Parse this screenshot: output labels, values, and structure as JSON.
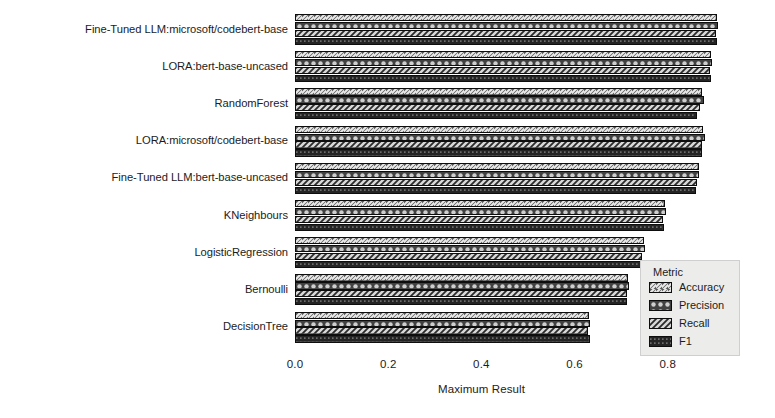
{
  "chart_data": {
    "type": "bar",
    "orientation": "horizontal",
    "grouped": true,
    "title": "",
    "xlabel": "Maximum Result",
    "ylabel": "Model Type",
    "xlim": [
      0,
      0.95
    ],
    "xticks": [
      "0.0",
      "0.2",
      "0.4",
      "0.6",
      "0.8"
    ],
    "xtick_values": [
      0.0,
      0.2,
      0.4,
      0.6,
      0.8
    ],
    "grid": false,
    "legend": {
      "title": "Metric",
      "position": "lower-right",
      "entries": [
        "Accuracy",
        "Precision",
        "Recall",
        "F1"
      ]
    },
    "categories": [
      "Fine-Tuned LLM:microsoft/codebert-base",
      "LORA:bert-base-uncased",
      "RandomForest",
      "LORA:microsoft/codebert-base",
      "Fine-Tuned LLM:bert-base-uncased",
      "KNeighbours",
      "LogisticRegression",
      "Bernoulli",
      "DecisionTree"
    ],
    "series": [
      {
        "name": "Accuracy",
        "pattern": "forward-hatch",
        "color": "#545454",
        "values": [
          0.905,
          0.893,
          0.873,
          0.876,
          0.866,
          0.793,
          0.749,
          0.714,
          0.63
        ]
      },
      {
        "name": "Precision",
        "pattern": "dots",
        "color": "#4a4a4a",
        "values": [
          0.908,
          0.895,
          0.878,
          0.88,
          0.868,
          0.796,
          0.752,
          0.717,
          0.634
        ]
      },
      {
        "name": "Recall",
        "pattern": "back-hatch",
        "color": "#d8d8d8",
        "values": [
          0.903,
          0.89,
          0.87,
          0.873,
          0.863,
          0.79,
          0.745,
          0.712,
          0.628
        ]
      },
      {
        "name": "F1",
        "pattern": "solid-dark",
        "color": "#262626",
        "values": [
          0.906,
          0.892,
          0.863,
          0.874,
          0.861,
          0.791,
          0.747,
          0.713,
          0.632
        ]
      }
    ]
  }
}
